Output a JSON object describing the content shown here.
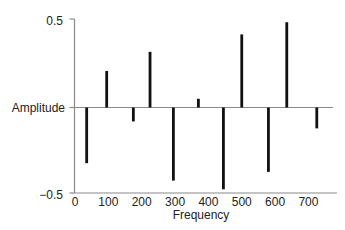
{
  "chart_data": {
    "type": "bar",
    "subtype": "stem",
    "title": "",
    "xlabel": "Frequency",
    "ylabel": "Amplitude",
    "xlim": [
      0,
      780
    ],
    "ylim": [
      -0.5,
      0.5
    ],
    "x_ticks": [
      0,
      100,
      200,
      300,
      400,
      500,
      600,
      700
    ],
    "x_tick_labels": [
      "0",
      "100",
      "200",
      "300",
      "400",
      "500",
      "600",
      "700"
    ],
    "y_tick_labels": [
      "0.5",
      "−0.5"
    ],
    "y_ticks": [
      0.5,
      -0.5
    ],
    "grid": false,
    "legend": null,
    "x": [
      35,
      95,
      175,
      225,
      295,
      370,
      445,
      500,
      580,
      635,
      725
    ],
    "values": [
      -0.32,
      0.21,
      -0.08,
      0.32,
      -0.42,
      0.05,
      -0.47,
      0.42,
      -0.37,
      0.49,
      -0.12
    ],
    "colors": {
      "bars": "#111111",
      "axes": "#8a8a8a",
      "zero_line": "#8a8a8a",
      "text": "#222222"
    }
  }
}
